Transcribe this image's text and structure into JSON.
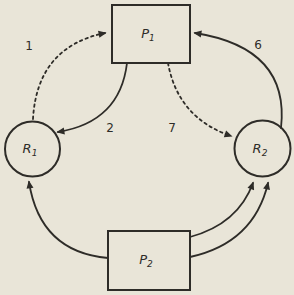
{
  "figure": {
    "type": "resource-allocation-graph",
    "background_color": "#e9e5d8",
    "ink_color": "#2e2c28",
    "nodes": [
      {
        "id": "P1",
        "shape": "rectangle",
        "label": "P",
        "subscript": "1"
      },
      {
        "id": "R1",
        "shape": "circle",
        "label": "R",
        "subscript": "1"
      },
      {
        "id": "R2",
        "shape": "circle",
        "label": "R",
        "subscript": "2"
      },
      {
        "id": "P2",
        "shape": "rectangle",
        "label": "P",
        "subscript": "2"
      }
    ],
    "edges": [
      {
        "id": "edge-1",
        "label": "1",
        "from": "R1",
        "to": "P1",
        "style": "dashed"
      },
      {
        "id": "edge-2",
        "label": "2",
        "from": "P1",
        "to": "R1",
        "style": "solid"
      },
      {
        "id": "edge-6",
        "label": "6",
        "from": "R2",
        "to": "P1",
        "style": "solid"
      },
      {
        "id": "edge-7",
        "label": "7",
        "from": "P1",
        "to": "R2",
        "style": "dashed"
      },
      {
        "id": "edge-p2-r1",
        "label": "",
        "from": "P2",
        "to": "R1",
        "style": "solid"
      },
      {
        "id": "edge-p2-r2-a",
        "label": "",
        "from": "P2",
        "to": "R2",
        "style": "solid"
      },
      {
        "id": "edge-p2-r2-b",
        "label": "",
        "from": "P2",
        "to": "R2",
        "style": "solid"
      }
    ]
  }
}
